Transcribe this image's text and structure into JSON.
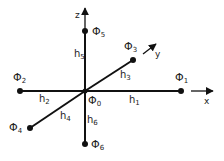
{
  "diagram": {
    "type": "stencil-6-neighbors",
    "axes": [
      {
        "id": "x",
        "label": "x"
      },
      {
        "id": "y",
        "label": "y"
      },
      {
        "id": "z",
        "label": "z"
      }
    ],
    "nodes": [
      {
        "id": "phi0",
        "symbol": "Φ",
        "sub": "0",
        "x": 85,
        "y": 91
      },
      {
        "id": "phi1",
        "symbol": "Φ",
        "sub": "1",
        "x": 181,
        "y": 91
      },
      {
        "id": "phi2",
        "symbol": "Φ",
        "sub": "2",
        "x": 20,
        "y": 91
      },
      {
        "id": "phi3",
        "symbol": "Φ",
        "sub": "3",
        "x": 133,
        "y": 60
      },
      {
        "id": "phi4",
        "symbol": "Φ",
        "sub": "4",
        "x": 30,
        "y": 128
      },
      {
        "id": "phi5",
        "symbol": "Φ",
        "sub": "5",
        "x": 85,
        "y": 31
      },
      {
        "id": "phi6",
        "symbol": "Φ",
        "sub": "6",
        "x": 85,
        "y": 144
      }
    ],
    "edges": [
      {
        "id": "h1",
        "label": "h",
        "sub": "1",
        "from": "phi0",
        "to": "phi1"
      },
      {
        "id": "h2",
        "label": "h",
        "sub": "2",
        "from": "phi0",
        "to": "phi2"
      },
      {
        "id": "h3",
        "label": "h",
        "sub": "3",
        "from": "phi0",
        "to": "phi3"
      },
      {
        "id": "h4",
        "label": "h",
        "sub": "4",
        "from": "phi0",
        "to": "phi4"
      },
      {
        "id": "h5",
        "label": "h",
        "sub": "5",
        "from": "phi0",
        "to": "phi5"
      },
      {
        "id": "h6",
        "label": "h",
        "sub": "6",
        "from": "phi0",
        "to": "phi6"
      }
    ],
    "labels": {
      "phi": "Φ",
      "h": "h",
      "x": "x",
      "y": "y",
      "z": "z",
      "s0": "0",
      "s1": "1",
      "s2": "2",
      "s3": "3",
      "s4": "4",
      "s5": "5",
      "s6": "6"
    },
    "colors": {
      "line": "#111111",
      "text": "#222222",
      "background": "#ffffff"
    }
  }
}
